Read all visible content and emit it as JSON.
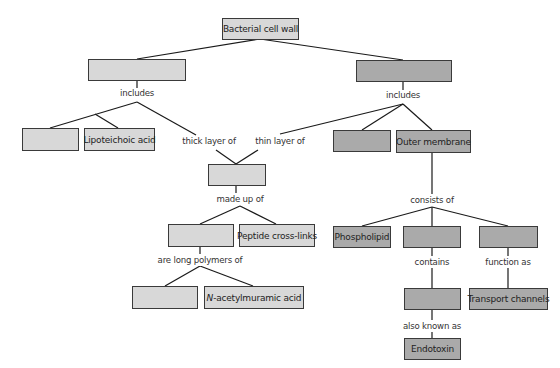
{
  "diagram": {
    "title": "Bacterial cell wall",
    "colors": {
      "light_box": "#d8d8d8",
      "dark_box": "#aaaaaa",
      "border": "#3a3a3a",
      "line": "#1a1a1a"
    },
    "nodes": {
      "root": "Bacterial cell wall",
      "left_top": "",
      "right_top": "",
      "left_blank_1": "",
      "lipoteichoic": "Lipoteichoic acid",
      "right_blank_1": "",
      "outer_membrane": "Outer membrane",
      "center_blank": "",
      "polymer_blank": "",
      "peptide": "Peptide cross-links",
      "sugar_blank": "",
      "nam_prefix": "N",
      "nam_rest": "-acetylmuramic acid",
      "phospholipid": "Phospholipid",
      "om_blank_1": "",
      "om_blank_2": "",
      "lps_blank": "",
      "transport": "Transport channels",
      "endotoxin": "Endotoxin"
    },
    "links": {
      "includes_left": "includes",
      "includes_right": "includes",
      "thick_layer": "thick layer of",
      "thin_layer": "thin layer of",
      "made_up_of": "made up of",
      "long_polymers": "are long polymers of",
      "consists_of": "consists of",
      "contains": "contains",
      "function_as": "function as",
      "also_known_as": "also known as"
    }
  }
}
